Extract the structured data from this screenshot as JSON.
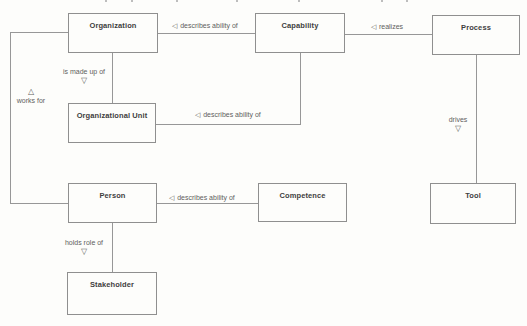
{
  "diagram": {
    "nodes": {
      "organization": {
        "label": "Organization"
      },
      "capability": {
        "label": "Capability"
      },
      "process": {
        "label": "Process"
      },
      "organizational_unit": {
        "label": "Organizational Unit"
      },
      "person": {
        "label": "Person"
      },
      "competence": {
        "label": "Competence"
      },
      "tool": {
        "label": "Tool"
      },
      "stakeholder": {
        "label": "Stakeholder"
      }
    },
    "edges": {
      "describes_org": {
        "marker": "◁",
        "text": "describes ability of"
      },
      "realizes": {
        "marker": "◁",
        "text": "realizes"
      },
      "is_made_up_of": {
        "text": "is made up of",
        "marker": "▽"
      },
      "works_for": {
        "marker": "△",
        "text": "works for"
      },
      "describes_org_unit": {
        "marker": "◁",
        "text": "describes ability of"
      },
      "drives": {
        "text": "drives",
        "marker": "▽"
      },
      "describes_person": {
        "marker": "◁",
        "text": "describes ability of"
      },
      "holds_role_of": {
        "text": "holds role of",
        "marker": "▽"
      }
    },
    "colors": {
      "background": "#fdfdfb",
      "box_fill": "#fdfdfb",
      "box_border": "#8f8f8f",
      "line": "#979797",
      "node_text": "#3e3e3e",
      "edge_text": "#5d5d5d"
    }
  },
  "artifacts": {
    "top_edge_fragment_x": [
      105,
      131,
      176,
      236,
      298,
      381,
      406
    ]
  }
}
